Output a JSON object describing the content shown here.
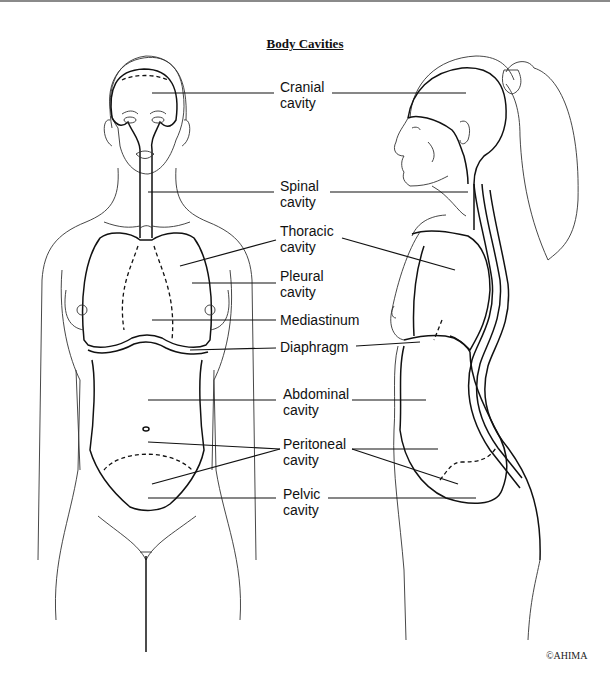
{
  "title": "Body Cavities",
  "labels": {
    "cranial": {
      "line1": "Cranial",
      "line2": "cavity"
    },
    "spinal": {
      "line1": "Spinal",
      "line2": "cavity"
    },
    "thoracic": {
      "line1": "Thoracic",
      "line2": "cavity"
    },
    "pleural": {
      "line1": "Pleural",
      "line2": "cavity"
    },
    "mediastinum": {
      "line1": "Mediastinum"
    },
    "diaphragm": {
      "line1": "Diaphragm"
    },
    "abdominal": {
      "line1": "Abdominal",
      "line2": "cavity"
    },
    "peritoneal": {
      "line1": "Peritoneal",
      "line2": "cavity"
    },
    "pelvic": {
      "line1": "Pelvic",
      "line2": "cavity"
    }
  },
  "copyright": "©AHIMA",
  "colors": {
    "line": "#111111",
    "background": "#ffffff",
    "border": "#8a8a8a"
  }
}
